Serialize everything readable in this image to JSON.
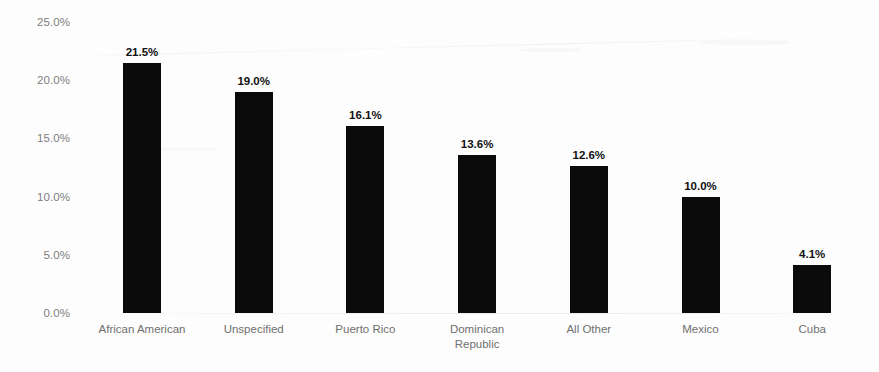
{
  "chart_data": {
    "type": "bar",
    "title": "",
    "subtitle": "",
    "xlabel": "",
    "ylabel": "",
    "categories": [
      "African American",
      "Unspecified",
      "Puerto Rico",
      "Dominican\nRepublic",
      "All Other",
      "Mexico",
      "Cuba"
    ],
    "values": [
      21.5,
      19.0,
      16.1,
      13.6,
      12.6,
      10.0,
      4.1
    ],
    "value_labels": [
      "21.5%",
      "19.0%",
      "16.1%",
      "13.6%",
      "12.6%",
      "10.0%",
      "4.1%"
    ],
    "ylim": [
      0,
      25
    ],
    "ytick_values": [
      0,
      5,
      10,
      15,
      20,
      25
    ],
    "ytick_labels": [
      "0.0%",
      "5.0%",
      "10.0%",
      "15.0%",
      "20.0%",
      "25.0%"
    ],
    "grid": false,
    "legend": null,
    "bar_color": "#0b0b0b",
    "tick_label_color": "#7d7d7d",
    "category_label_color": "#6f6f6f",
    "value_label_color": "#111111",
    "background_color": "#fdfdfd"
  }
}
